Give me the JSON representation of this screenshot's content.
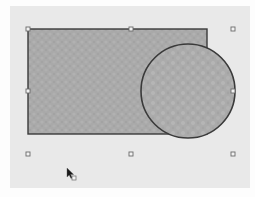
{
  "editor": {
    "name": "drawing-canvas",
    "colors": {
      "page_background": "#fdfdfd",
      "canvas_background": "#e9e9e9",
      "shape_fill": "#a9a9a9",
      "shape_texture_light": "#b9b9b9",
      "shape_texture_dark": "#9c9c9c",
      "shape_outline": "#3a3a3a",
      "handle_fill": "#f2f2f2",
      "handle_stroke": "#6a6a6a",
      "cursor": "#1a1a1a"
    },
    "shapes": [
      {
        "id": "rectangle",
        "kind": "rectangle",
        "fill": "textured-gray",
        "selected": true
      },
      {
        "id": "ellipse",
        "kind": "circle",
        "fill": "textured-gray",
        "selected": true
      }
    ],
    "selection": {
      "handle_count": 8,
      "handle_positions": [
        "top-left",
        "top-center",
        "top-right",
        "middle-left",
        "middle-right",
        "bottom-left",
        "bottom-center",
        "bottom-right"
      ]
    },
    "cursor": {
      "type": "arrow-copy-icon"
    }
  }
}
